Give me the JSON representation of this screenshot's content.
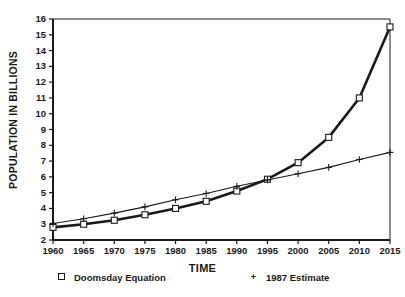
{
  "chart_data": {
    "type": "line",
    "title": "",
    "xlabel": "TIME",
    "ylabel": "POPULATION IN BILLIONS",
    "xlim": [
      1960,
      2015
    ],
    "ylim": [
      2,
      16
    ],
    "xticks": [
      "1960",
      "1965",
      "1970",
      "1975",
      "1980",
      "1985",
      "1990",
      "1995",
      "2000",
      "2005",
      "2010",
      "2015"
    ],
    "yticks": [
      "16",
      "15",
      "14",
      "13",
      "12",
      "11",
      "10",
      "9",
      "8",
      "7",
      "6",
      "5",
      "4",
      "3",
      "2"
    ],
    "grid": false,
    "legend_position": "below-axes",
    "x": [
      1960,
      1965,
      1970,
      1975,
      1980,
      1985,
      1990,
      1995,
      2000,
      2005,
      2010,
      2015
    ],
    "series": [
      {
        "name": "Doomsday Equation",
        "marker": "square",
        "values": [
          2.8,
          3.0,
          3.25,
          3.6,
          4.0,
          4.45,
          5.1,
          5.85,
          6.9,
          8.5,
          11.0,
          15.5
        ]
      },
      {
        "name": "1987 Estimate",
        "marker": "plus",
        "values": [
          3.05,
          3.35,
          3.7,
          4.1,
          4.55,
          4.95,
          5.4,
          5.8,
          6.2,
          6.6,
          7.1,
          7.55
        ]
      }
    ]
  },
  "legend": {
    "doomsday": {
      "marker": "square-marker",
      "label": "Doomsday Equation"
    },
    "estimate": {
      "marker": "plus-marker",
      "label": "1987 Estimate"
    }
  },
  "colors": {
    "axis": "#1a1a1a",
    "doomsday_line": "#1a1a1a",
    "estimate_line": "#1a1a1a",
    "background": "#ffffff"
  }
}
